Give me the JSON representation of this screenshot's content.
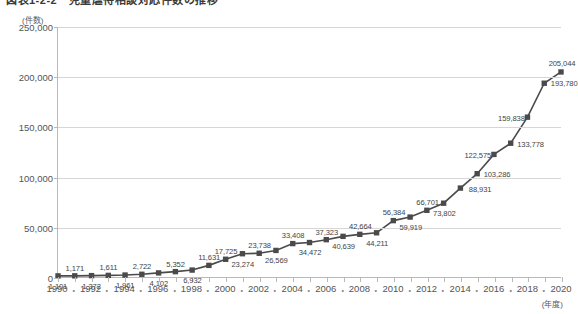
{
  "chart_title": "図表1-2-2　児童虐待相談対応件数の推移",
  "axis": {
    "y_unit": "(件数)",
    "x_unit": "(年度)",
    "y_ticks": [
      "0",
      "50,000",
      "100,000",
      "150,000",
      "200,000",
      "250,000"
    ],
    "x_ticks": [
      "1990",
      "1992",
      "1994",
      "1996",
      "1998",
      "2000",
      "2002",
      "2004",
      "2006",
      "2008",
      "2010",
      "2012",
      "2014",
      "2016",
      "2018",
      "2020"
    ],
    "x_separator": "・"
  },
  "chart_data": {
    "type": "line",
    "title": "図表1-2-2　児童虐待相談対応件数の推移",
    "xlabel": "(年度)",
    "ylabel": "(件数)",
    "ylim": [
      0,
      250000
    ],
    "xlim": [
      1990,
      2020
    ],
    "grid": true,
    "legend": "none",
    "marker": "square",
    "line_color": "#4a4a4a",
    "marker_color": "#4a4a4a",
    "x": [
      1990,
      1991,
      1992,
      1993,
      1994,
      1995,
      1996,
      1997,
      1998,
      1999,
      2000,
      2001,
      2002,
      2003,
      2004,
      2005,
      2006,
      2007,
      2008,
      2009,
      2010,
      2011,
      2012,
      2013,
      2014,
      2015,
      2016,
      2017,
      2018,
      2019,
      2020
    ],
    "categories": [
      "1990",
      "1991",
      "1992",
      "1993",
      "1994",
      "1995",
      "1996",
      "1997",
      "1998",
      "1999",
      "2000",
      "2001",
      "2002",
      "2003",
      "2004",
      "2005",
      "2006",
      "2007",
      "2008",
      "2009",
      "2010",
      "2011",
      "2012",
      "2013",
      "2014",
      "2015",
      "2016",
      "2017",
      "2018",
      "2019",
      "2020"
    ],
    "values": [
      1101,
      1171,
      1372,
      1611,
      1961,
      2722,
      4102,
      5352,
      6932,
      11631,
      17725,
      23274,
      23738,
      26569,
      33408,
      34472,
      37323,
      40639,
      42664,
      44211,
      56384,
      59919,
      66701,
      73802,
      88931,
      103286,
      122575,
      133778,
      159838,
      193780,
      205044
    ],
    "data_labels": [
      "1,101",
      "1,171",
      "1,372",
      "1,611",
      "1,961",
      "2,722",
      "4,102",
      "5,352",
      "6,932",
      "11,631",
      "17,725",
      "23,274",
      "23,738",
      "26,569",
      "33,408",
      "34,472",
      "37,323",
      "40,639",
      "42,664",
      "44,211",
      "56,384",
      "59,919",
      "66,701",
      "73,802",
      "88,931",
      "103,286",
      "122,575",
      "133,778",
      "159,838",
      "193,780",
      "205,044"
    ],
    "label_positions": [
      "below",
      "above",
      "below",
      "above",
      "below",
      "above",
      "below",
      "above",
      "below",
      "above",
      "above",
      "below",
      "above",
      "below",
      "above",
      "below",
      "above",
      "below",
      "above",
      "below",
      "above",
      "below",
      "above",
      "below",
      "right",
      "right",
      "left",
      "right",
      "left",
      "right",
      "above"
    ]
  }
}
